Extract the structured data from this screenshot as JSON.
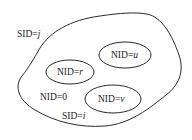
{
  "diagram": {
    "outer_region": {
      "label_prefix": "SID=",
      "label_var": "j"
    },
    "inner_region": {
      "label_prefix": "SID=",
      "label_var": "i",
      "default_node": "NID=0"
    },
    "nodes": [
      {
        "prefix": "NID=",
        "var": "r"
      },
      {
        "prefix": "NID=",
        "var": "u"
      },
      {
        "prefix": "NID=",
        "var": "v"
      }
    ],
    "colors": {
      "stroke": "#2a2a2a",
      "text": "#222222",
      "background": "#ffffff"
    }
  }
}
